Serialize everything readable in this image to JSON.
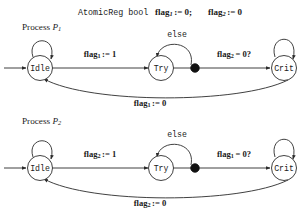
{
  "declaration": {
    "keyword": "AtomicReg bool",
    "var1_name": "flag",
    "var1_sub": "1",
    "var1_assign": ":= 0;",
    "var2_name": "flag",
    "var2_sub": "2",
    "var2_assign": ":= 0",
    "full_text": "AtomicReg bool flag1 := 0; flag2 := 0"
  },
  "colors": {
    "stroke": "#2b2b2b",
    "text": "#1a1a1a",
    "dot": "#111111",
    "background": "#ffffff"
  },
  "processes": [
    {
      "title_prefix": "Process ",
      "title_var": "P",
      "title_sub": "1",
      "states": [
        {
          "label": "Idle"
        },
        {
          "label": "Try"
        },
        {
          "label": "Crit"
        }
      ],
      "transitions": [
        {
          "name": "set-flag",
          "label_base": "flag",
          "label_sub": "1",
          "label_rest": ":= 1"
        },
        {
          "name": "guard-check",
          "label_base": "flag",
          "label_sub": "2",
          "label_rest": "= 0?"
        },
        {
          "name": "else-loop",
          "label_base": "else",
          "label_sub": "",
          "label_rest": ""
        },
        {
          "name": "release",
          "label_base": "flag",
          "label_sub": "1",
          "label_rest": ":= 0"
        }
      ]
    },
    {
      "title_prefix": "Process ",
      "title_var": "P",
      "title_sub": "2",
      "states": [
        {
          "label": "Idle"
        },
        {
          "label": "Try"
        },
        {
          "label": "Crit"
        }
      ],
      "transitions": [
        {
          "name": "set-flag",
          "label_base": "flag",
          "label_sub": "2",
          "label_rest": ":= 1"
        },
        {
          "name": "guard-check",
          "label_base": "flag",
          "label_sub": "1",
          "label_rest": "= 0?"
        },
        {
          "name": "else-loop",
          "label_base": "else",
          "label_sub": "",
          "label_rest": ""
        },
        {
          "name": "release",
          "label_base": "flag",
          "label_sub": "2",
          "label_rest": ":= 0"
        }
      ]
    }
  ]
}
